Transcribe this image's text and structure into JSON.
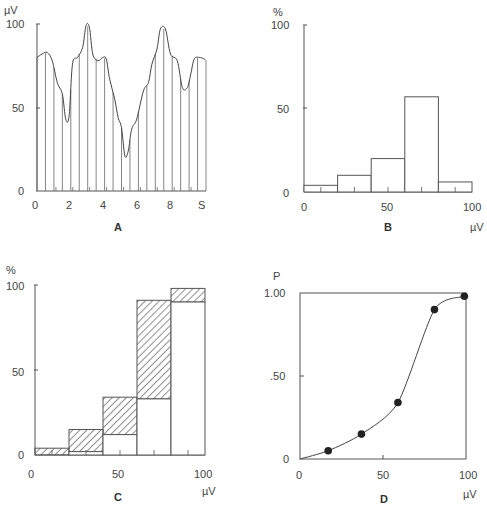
{
  "chart_data": [
    {
      "panel": "A",
      "type": "line",
      "title": "A",
      "ylabel": "µV",
      "xlabel": "S",
      "xticks": [
        "0",
        "2",
        "4",
        "6",
        "8",
        "S"
      ],
      "yticks": [
        "0",
        "50",
        "100"
      ],
      "xlim": [
        0,
        10
      ],
      "ylim": [
        0,
        100
      ],
      "x": [
        0,
        0.3,
        0.6,
        0.9,
        1.2,
        1.5,
        1.7,
        1.9,
        2.1,
        2.4,
        2.7,
        2.9,
        3.1,
        3.3,
        3.6,
        3.9,
        4.1,
        4.3,
        4.6,
        4.8,
        5.0,
        5.2,
        5.4,
        5.6,
        5.9,
        6.3,
        6.6,
        6.8,
        7.1,
        7.3,
        7.6,
        7.9,
        8.3,
        8.6,
        8.9,
        9.1,
        9.3,
        9.6,
        9.9,
        10
      ],
      "values": [
        80,
        82,
        83,
        78,
        65,
        58,
        43,
        45,
        76,
        80,
        86,
        99,
        98,
        82,
        78,
        80,
        79,
        67,
        55,
        44,
        38,
        21,
        24,
        37,
        43,
        60,
        65,
        76,
        85,
        97,
        97,
        82,
        78,
        62,
        62,
        70,
        79,
        80,
        79,
        78
      ],
      "sample_lines_x": [
        0.5,
        1.0,
        1.5,
        2.0,
        2.5,
        3.0,
        3.5,
        4.0,
        4.5,
        5.0,
        5.5,
        6.0,
        6.5,
        7.0,
        7.5,
        8.0,
        8.5,
        9.0,
        9.5,
        10.0
      ]
    },
    {
      "panel": "B",
      "type": "bar",
      "title": "B",
      "ylabel": "%",
      "xlabel": "µV",
      "xticks": [
        "0",
        "50",
        "100"
      ],
      "yticks": [
        "0",
        "50",
        "100"
      ],
      "categories": [
        "0-20",
        "20-40",
        "40-60",
        "60-80",
        "80-100"
      ],
      "values": [
        4,
        10,
        20,
        57,
        6
      ],
      "ylim": [
        0,
        100
      ]
    },
    {
      "panel": "C",
      "type": "bar",
      "title": "C",
      "ylabel": "%",
      "xlabel": "µV",
      "xticks": [
        "0",
        "50",
        "100"
      ],
      "yticks": [
        "0",
        "50",
        "100"
      ],
      "categories": [
        "0-20",
        "20-40",
        "40-60",
        "60-80",
        "80-100"
      ],
      "series": [
        {
          "name": "open",
          "values": [
            0,
            2,
            12,
            33,
            90
          ]
        },
        {
          "name": "hatched (total)",
          "values": [
            4,
            15,
            34,
            91,
            98
          ]
        }
      ],
      "ylim": [
        0,
        100
      ]
    },
    {
      "panel": "D",
      "type": "line",
      "title": "D",
      "ylabel": "P",
      "xlabel": "µV",
      "xticks": [
        "0",
        "50",
        "100"
      ],
      "yticks": [
        "0",
        ".50",
        "1.00"
      ],
      "x": [
        0,
        17,
        37,
        59,
        81,
        99
      ],
      "values": [
        0,
        0.05,
        0.15,
        0.34,
        0.9,
        0.98
      ],
      "markers_x": [
        17,
        37,
        59,
        81,
        99
      ],
      "markers_y": [
        0.05,
        0.15,
        0.34,
        0.9,
        0.98
      ],
      "xlim": [
        0,
        100
      ],
      "ylim": [
        0,
        1
      ]
    }
  ],
  "labels": {
    "a": {
      "title": "A",
      "ylabel": "µV",
      "xticks": [
        "0",
        "2",
        "4",
        "6",
        "8",
        "S"
      ],
      "yticks": [
        "0",
        "50",
        "100"
      ]
    },
    "b": {
      "title": "B",
      "ylabel": "%",
      "xlabel": "µV",
      "xticks": [
        "0",
        "50",
        "100"
      ],
      "yticks": [
        "0",
        "50",
        "100"
      ]
    },
    "c": {
      "title": "C",
      "ylabel": "%",
      "xlabel": "µV",
      "xticks": [
        "0",
        "50",
        "100"
      ],
      "yticks": [
        "0",
        "50",
        "100"
      ]
    },
    "d": {
      "title": "D",
      "ylabel": "P",
      "xlabel": "µV",
      "xticks": [
        "0",
        "50",
        "100"
      ],
      "yticks": [
        "0",
        ".50",
        "1.00"
      ]
    }
  }
}
